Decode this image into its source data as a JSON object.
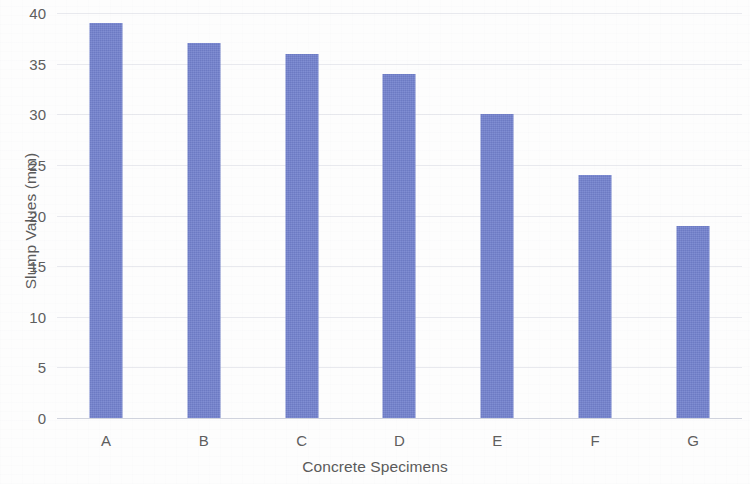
{
  "chart_data": {
    "type": "bar",
    "title": "",
    "xlabel": "Concrete Specimens",
    "ylabel": "Slump Values (mm)",
    "categories": [
      "A",
      "B",
      "C",
      "D",
      "E",
      "F",
      "G"
    ],
    "values": [
      39,
      37,
      36,
      34,
      30,
      24,
      19
    ],
    "series": [
      {
        "name": "Slump Values",
        "values": [
          39,
          37,
          36,
          34,
          30,
          24,
          19
        ]
      }
    ],
    "ylim": [
      0,
      40
    ],
    "ytick_labels": [
      "0",
      "5",
      "10",
      "15",
      "20",
      "25",
      "30",
      "35",
      "40"
    ],
    "ytick_values": [
      0,
      5,
      10,
      15,
      20,
      25,
      30,
      35,
      40
    ],
    "ytick_step": 5,
    "grid": "horizontal",
    "legend": "none",
    "bar_color": "#7281ce",
    "gridline_color": "#c4c9d6",
    "text_color": "#5a5a5a",
    "background_color": "#fdfdfd"
  }
}
